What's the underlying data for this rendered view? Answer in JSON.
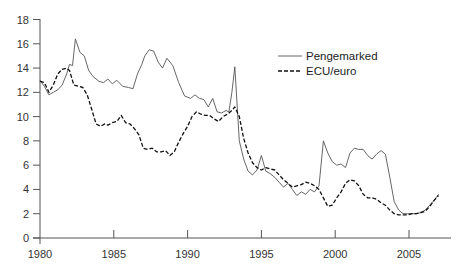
{
  "chart_data": {
    "type": "line",
    "title": "",
    "xlabel": "",
    "ylabel": "",
    "xlim": [
      1980,
      2007.3
    ],
    "ylim": [
      0,
      18
    ],
    "grid": false,
    "legend_position": "upper right (inside plot)",
    "x_ticks": [
      1980,
      1985,
      1990,
      1995,
      2000,
      2005
    ],
    "y_ticks": [
      0,
      2,
      4,
      6,
      8,
      10,
      12,
      14,
      16,
      18
    ],
    "series": [
      {
        "name": "Pengemarked",
        "style": "solid",
        "color": "#555555",
        "x": [
          1980.0,
          1980.3,
          1980.6,
          1980.9,
          1981.2,
          1981.5,
          1981.8,
          1982.0,
          1982.2,
          1982.4,
          1982.7,
          1983.0,
          1983.3,
          1983.6,
          1984.0,
          1984.3,
          1984.6,
          1984.9,
          1985.2,
          1985.6,
          1986.0,
          1986.3,
          1986.6,
          1986.9,
          1987.1,
          1987.4,
          1987.7,
          1988.0,
          1988.3,
          1988.6,
          1989.0,
          1989.4,
          1989.8,
          1990.2,
          1990.5,
          1990.8,
          1991.1,
          1991.4,
          1991.7,
          1992.0,
          1992.3,
          1992.6,
          1992.8,
          1993.0,
          1993.2,
          1993.5,
          1993.8,
          1994.1,
          1994.4,
          1994.7,
          1995.0,
          1995.3,
          1995.6,
          1995.9,
          1996.2,
          1996.5,
          1996.8,
          1997.1,
          1997.4,
          1997.7,
          1998.0,
          1998.3,
          1998.6,
          1998.9,
          1999.2,
          1999.5,
          1999.8,
          2000.1,
          2000.4,
          2000.7,
          2001.0,
          2001.3,
          2001.6,
          2001.9,
          2002.2,
          2002.5,
          2002.8,
          2003.1,
          2003.4,
          2003.7,
          2004.0,
          2004.3,
          2004.6,
          2004.9,
          2005.2,
          2005.5,
          2005.8,
          2006.1,
          2006.4,
          2006.7,
          2007.0
        ],
        "values": [
          13.0,
          12.5,
          11.8,
          12.0,
          12.2,
          12.6,
          13.5,
          14.3,
          14.2,
          16.4,
          15.3,
          15.0,
          13.8,
          13.3,
          12.9,
          12.8,
          13.1,
          12.7,
          13.0,
          12.5,
          12.4,
          12.3,
          13.5,
          14.3,
          15.0,
          15.5,
          15.4,
          14.5,
          14.0,
          14.8,
          14.2,
          12.8,
          11.7,
          11.5,
          11.8,
          11.5,
          11.4,
          10.8,
          11.5,
          10.4,
          10.3,
          10.5,
          10.4,
          12.0,
          14.1,
          8.0,
          6.5,
          5.5,
          5.2,
          5.6,
          6.8,
          5.5,
          5.3,
          5.0,
          4.6,
          4.2,
          4.5,
          4.0,
          3.5,
          3.8,
          3.6,
          4.0,
          3.8,
          4.3,
          8.0,
          7.0,
          6.3,
          6.0,
          6.1,
          5.8,
          7.0,
          7.4,
          7.3,
          7.3,
          6.8,
          6.5,
          6.9,
          7.2,
          6.9,
          5.0,
          3.0,
          2.3,
          2.0,
          2.0,
          2.0,
          2.0,
          2.1,
          2.3,
          2.7,
          3.1,
          3.6
        ]
      },
      {
        "name": "ECU/euro",
        "style": "dashed",
        "color": "#111111",
        "x": [
          1980.0,
          1980.3,
          1980.6,
          1980.9,
          1981.2,
          1981.5,
          1981.8,
          1982.0,
          1982.3,
          1982.6,
          1982.9,
          1983.2,
          1983.5,
          1983.8,
          1984.1,
          1984.4,
          1984.6,
          1984.9,
          1985.2,
          1985.5,
          1985.8,
          1986.1,
          1986.4,
          1986.7,
          1987.0,
          1987.3,
          1987.6,
          1987.9,
          1988.2,
          1988.5,
          1988.8,
          1989.1,
          1989.4,
          1989.7,
          1990.0,
          1990.3,
          1990.6,
          1990.9,
          1991.2,
          1991.5,
          1991.8,
          1992.1,
          1992.4,
          1992.7,
          1993.0,
          1993.2,
          1993.5,
          1993.8,
          1994.1,
          1994.4,
          1994.7,
          1995.0,
          1995.3,
          1995.6,
          1995.9,
          1996.2,
          1996.5,
          1996.8,
          1997.1,
          1997.4,
          1997.7,
          1998.0,
          1998.3,
          1998.6,
          1998.9,
          1999.2,
          1999.5,
          1999.8,
          2000.1,
          2000.4,
          2000.7,
          2001.0,
          2001.3,
          2001.6,
          2001.9,
          2002.2,
          2002.5,
          2002.8,
          2003.1,
          2003.4,
          2003.7,
          2004.0,
          2004.3,
          2004.6,
          2004.9,
          2005.2,
          2005.5,
          2005.8,
          2006.1,
          2006.4,
          2006.7,
          2007.0
        ],
        "values": [
          12.9,
          12.8,
          12.0,
          12.6,
          13.5,
          13.9,
          14.0,
          13.8,
          12.6,
          12.5,
          12.4,
          11.8,
          10.6,
          9.4,
          9.2,
          9.4,
          9.3,
          9.5,
          9.6,
          10.1,
          9.5,
          9.4,
          9.0,
          8.5,
          7.4,
          7.3,
          7.4,
          7.1,
          7.1,
          7.2,
          6.8,
          7.1,
          7.9,
          8.6,
          9.2,
          10.0,
          10.4,
          10.2,
          10.1,
          10.1,
          9.8,
          9.6,
          10.0,
          10.2,
          10.5,
          10.8,
          10.0,
          8.2,
          7.0,
          6.2,
          5.8,
          5.6,
          5.8,
          5.7,
          5.6,
          5.2,
          4.8,
          4.5,
          4.2,
          4.3,
          4.4,
          4.6,
          4.5,
          4.3,
          4.0,
          3.3,
          2.6,
          2.7,
          3.3,
          3.8,
          4.5,
          4.8,
          4.7,
          4.3,
          3.6,
          3.3,
          3.3,
          3.2,
          2.9,
          2.7,
          2.3,
          2.0,
          1.9,
          1.9,
          1.9,
          2.0,
          2.0,
          2.1,
          2.2,
          2.6,
          3.1,
          3.5
        ]
      }
    ]
  },
  "legend": {
    "items": [
      {
        "label": "Pengemarked",
        "style": "solid"
      },
      {
        "label": "ECU/euro",
        "style": "dashed"
      }
    ]
  },
  "axes": {
    "x_tick_labels": [
      "1980",
      "1985",
      "1990",
      "1995",
      "2000",
      "2005"
    ],
    "y_tick_labels": [
      "0",
      "2",
      "4",
      "6",
      "8",
      "10",
      "12",
      "14",
      "16",
      "18"
    ]
  }
}
